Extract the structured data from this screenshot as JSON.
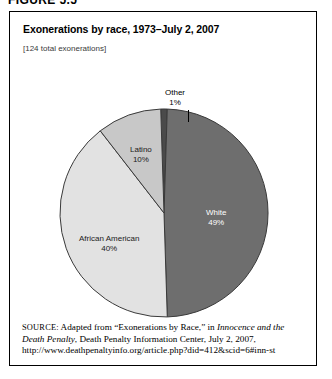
{
  "figure": {
    "label": "FIGURE 5.5"
  },
  "chart": {
    "title": "Exonerations by race, 1973–July 2, 2007",
    "subtitle": "[124 total exonerations]"
  },
  "source": {
    "kicker": "SOURCE:",
    "text_before_italic1": " Adapted from “Exonerations by Race,” in ",
    "italic1": "Innocence and the Death Penalty",
    "text_after": ", Death Penalty Information Center, July 2, 2007, http://www.deathpenaltyinfo.org/article.php?did=412&scid=6#inn-st"
  },
  "labels": {
    "white_name": "White",
    "white_pct": "49%",
    "african_american_name": "African American",
    "african_american_pct": "40%",
    "latino_name": "Latino",
    "latino_pct": "10%",
    "other_name": "Other",
    "other_pct": "1%"
  },
  "colors": {
    "white_slice": "#6e6e6e",
    "african_american_slice": "#e2e2e2",
    "latino_slice": "#c8c8c8",
    "other_slice": "#4a4a4a",
    "outline": "#3a3a3a",
    "background": "#ffffff"
  },
  "chart_data": {
    "type": "pie",
    "title": "Exonerations by race, 1973–July 2, 2007",
    "subtitle": "[124 total exonerations]",
    "total": 124,
    "unit": "percent",
    "legend": "none (slices labeled in place)",
    "start_angle_deg": 0,
    "direction": "clockwise",
    "categories": [
      "White",
      "African American",
      "Latino",
      "Other"
    ],
    "values": [
      49,
      40,
      10,
      1
    ],
    "slices": [
      {
        "label": "White",
        "value": 49,
        "display": "49%",
        "color": "#6e6e6e"
      },
      {
        "label": "African American",
        "value": 40,
        "display": "40%",
        "color": "#e2e2e2"
      },
      {
        "label": "Latino",
        "value": 10,
        "display": "10%",
        "color": "#c8c8c8"
      },
      {
        "label": "Other",
        "value": 1,
        "display": "1%",
        "color": "#4a4a4a"
      }
    ]
  }
}
